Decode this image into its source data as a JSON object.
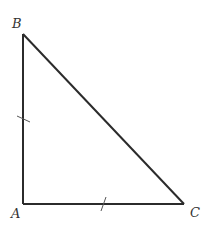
{
  "diagram": {
    "type": "right-triangle",
    "stroke_color": "#2b2b2b",
    "vertices": [
      {
        "label": "A",
        "x": 23,
        "y": 204,
        "label_x": 12,
        "label_y": 218
      },
      {
        "label": "B",
        "x": 23,
        "y": 34,
        "label_x": 12,
        "label_y": 28
      },
      {
        "label": "C",
        "x": 184,
        "y": 204,
        "label_x": 190,
        "label_y": 217
      }
    ],
    "sides": [
      {
        "name": "AB",
        "tick_marks": 1
      },
      {
        "name": "AC",
        "tick_marks": 1
      },
      {
        "name": "BC",
        "tick_marks": 0
      }
    ],
    "labels": {
      "A": "A",
      "B": "B",
      "C": "C"
    }
  }
}
